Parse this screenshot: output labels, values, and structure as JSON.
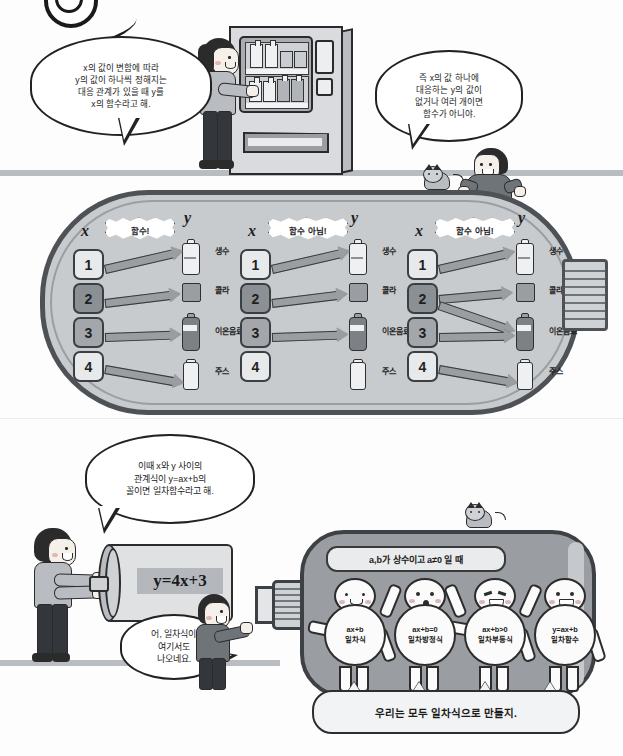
{
  "page": {
    "background": "#fdfdfd",
    "width": 623,
    "height": 756
  },
  "logo": {
    "name": "circular-logo-mark"
  },
  "top_scene": {
    "bubble_left": {
      "name": "speech-bubble-definition-of-function",
      "lines": [
        "x의 값이 변함에 따라",
        "y의 값이 하나씩 정해지는",
        "대응 관계가 있을 때 y를",
        "x의 함수라고 해."
      ]
    },
    "bubble_right": {
      "name": "speech-bubble-not-a-function",
      "lines": [
        "즉 x의 값 하나에",
        "대응하는 y의 값이",
        "없거나 여러 개이면",
        "함수가 아니야."
      ]
    },
    "vending_machine": {
      "label": "vending-machine"
    },
    "girl": {
      "label": "girl-at-vending-machine"
    },
    "boy": {
      "label": "boy-leaning-on-capsule"
    },
    "cat": {
      "label": "cat-on-capsule"
    }
  },
  "mapping_section": {
    "x_label": "x",
    "y_label": "y",
    "domain_values": [
      "1",
      "2",
      "3",
      "4"
    ],
    "codomain_items": [
      {
        "name": "생수",
        "icon": "water-bottle-icon"
      },
      {
        "name": "콜라",
        "icon": "cola-can-icon"
      },
      {
        "name": "이온음료",
        "icon": "sports-drink-bottle-icon"
      },
      {
        "name": "주스",
        "icon": "juice-bottle-icon"
      }
    ],
    "diagrams": [
      {
        "verdict": "함수!",
        "is_function": true,
        "mappings": [
          {
            "from": "1",
            "to": "생수"
          },
          {
            "from": "2",
            "to": "콜라"
          },
          {
            "from": "3",
            "to": "이온음료"
          },
          {
            "from": "4",
            "to": "주스"
          }
        ]
      },
      {
        "verdict": "함수 아님!",
        "is_function": false,
        "mappings": [
          {
            "from": "1",
            "to": "생수"
          },
          {
            "from": "2",
            "to": "콜라"
          },
          {
            "from": "3",
            "to": "이온음료"
          }
        ]
      },
      {
        "verdict": "함수 아님!",
        "is_function": false,
        "mappings": [
          {
            "from": "1",
            "to": "생수"
          },
          {
            "from": "2",
            "to": "콜라"
          },
          {
            "from": "2",
            "to": "이온음료"
          },
          {
            "from": "3",
            "to": "이온음료"
          },
          {
            "from": "4",
            "to": "주스"
          }
        ]
      }
    ]
  },
  "bottom_scene": {
    "bubble_linear": {
      "name": "speech-bubble-linear-function-definition",
      "lines": [
        "이때 x와 y 사이의",
        "관계식이 y=ax+b의",
        "꼴이면 일차함수라고 해."
      ]
    },
    "cylinder_equation": "y=4x+3",
    "bubble_boy": {
      "name": "speech-bubble-boy-remark",
      "lines": [
        "어, 일차식이",
        "여기서도",
        "나오네요."
      ]
    },
    "capsule_banner": "a,b가 상수이고 a≠0 일 때",
    "figures": [
      {
        "expr": "ax+b",
        "term": "일차식",
        "face": "smile"
      },
      {
        "expr": "ax+b=0",
        "term": "일차방정식",
        "face": "surprised"
      },
      {
        "expr": "ax+b>0",
        "term": "일차부등식",
        "face": "grin"
      },
      {
        "expr": "y=ax+b",
        "term": "일차함수",
        "face": "open"
      }
    ],
    "banner_text": "우리는 모두 일차식으로 만들지.",
    "woman": {
      "label": "woman-holding-cylinder"
    },
    "boy": {
      "label": "boy-pushing-plunger"
    },
    "cat": {
      "label": "cat-on-lower-capsule"
    }
  },
  "colors": {
    "capsule_fill": "#c8cbce",
    "capsule_stroke": "#4e5256",
    "lower_capsule_fill": "#9a9ea2",
    "arrow_fill": "#9a9ea2",
    "ink": "#221f1f",
    "paper": "#fdfdfd"
  }
}
